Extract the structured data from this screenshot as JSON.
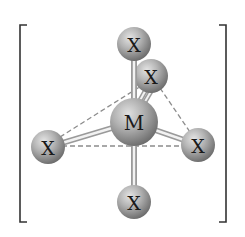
{
  "diagram": {
    "type": "octahedral complex ion (ball-and-stick)",
    "center_atom": {
      "label": "M",
      "cx": 134,
      "cy": 122,
      "r": 24
    },
    "ligands": [
      {
        "id": "top",
        "label": "X",
        "cx": 134,
        "cy": 44,
        "r": 17
      },
      {
        "id": "back",
        "label": "X",
        "cx": 151,
        "cy": 76,
        "r": 17
      },
      {
        "id": "left",
        "label": "X",
        "cx": 48,
        "cy": 147,
        "r": 17
      },
      {
        "id": "right",
        "label": "X",
        "cx": 198,
        "cy": 145,
        "r": 17
      },
      {
        "id": "bottom",
        "label": "X",
        "cx": 134,
        "cy": 202,
        "r": 17
      }
    ],
    "bonds": [
      "M-top",
      "M-back",
      "M-left",
      "M-right",
      "M-bottom"
    ],
    "dashed_edges": [
      "left-back",
      "back-right",
      "left-right"
    ],
    "brackets": {
      "left_x": 20,
      "right_x": 226,
      "top_y": 25,
      "bottom_y": 222
    },
    "colors": {
      "sphere_light": "#d8d8d8",
      "sphere_mid": "#a8a8a8",
      "sphere_dark": "#6e6e6e",
      "bond": "#9a9a9a",
      "bond_highlight": "#f2f2f2",
      "dash": "#8a8a8a",
      "bracket": "#333333"
    }
  }
}
